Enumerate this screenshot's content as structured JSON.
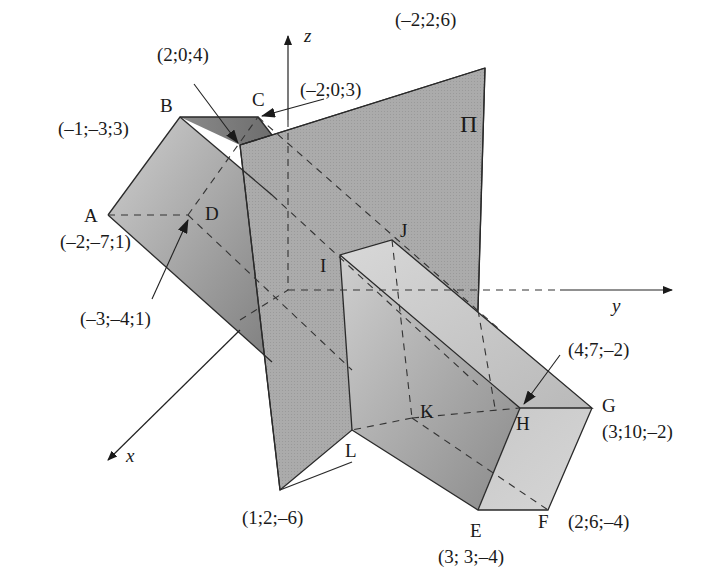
{
  "diagram": {
    "axes": {
      "x": "x",
      "y": "y",
      "z": "z"
    },
    "plane": {
      "label": "Π",
      "corner_top": "(–2;2;6)",
      "corner_bottom": "(1;2;–6)",
      "upper_points": {
        "p1": "(2;0;4)",
        "p2": "(–2;0;3)"
      }
    },
    "prism_left": {
      "A": {
        "name": "A",
        "coord": "(–2;–7;1)"
      },
      "B": {
        "name": "B",
        "coord": "(–1;–3;3)"
      },
      "C": {
        "name": "C",
        "coord": ""
      },
      "D": {
        "name": "D",
        "coord": "(–3;–4;1)"
      }
    },
    "prism_right": {
      "E": {
        "name": "E",
        "coord": "(3; 3;–4)"
      },
      "F": {
        "name": "F",
        "coord": "(2;6;–4)"
      },
      "G": {
        "name": "G",
        "coord": "(3;10;–2)"
      },
      "H": {
        "name": "H",
        "coord": "(4;7;–2)"
      },
      "I": {
        "name": "I"
      },
      "J": {
        "name": "J"
      },
      "K": {
        "name": "K"
      },
      "L": {
        "name": "L"
      }
    },
    "colors": {
      "plane_fill": "#a9a9a9",
      "prism_dark": "#8c8c8c",
      "prism_light": "#c4c4c4",
      "prism_top": "#7a7a7a",
      "line": "#2a2a2a"
    }
  }
}
